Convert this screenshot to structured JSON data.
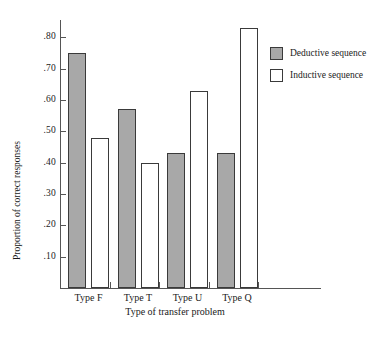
{
  "chart_data": {
    "type": "bar",
    "title": "",
    "subtitle": "",
    "xlabel": "Type of transfer problem",
    "ylabel": "Proportion of correct responses",
    "categories": [
      "Type F",
      "Type T",
      "Type U",
      "Type Q"
    ],
    "series": [
      {
        "name": "Deductive sequence",
        "color": "#a8a8a8",
        "values": [
          0.75,
          0.57,
          0.43,
          0.43
        ]
      },
      {
        "name": "Inductive sequence",
        "color": "#ffffff",
        "values": [
          0.48,
          0.4,
          0.63,
          0.83
        ]
      }
    ],
    "ylim": [
      0.0,
      0.855
    ],
    "ytick_values": [
      0.1,
      0.2,
      0.3,
      0.4,
      0.5,
      0.6,
      0.7,
      0.8
    ],
    "ytick_labels": [
      ".10",
      ".20",
      ".30",
      ".40",
      ".50",
      ".60",
      ".70",
      ".80"
    ],
    "grid": false,
    "legend_position": "right-top",
    "bar_edge_color": "#3a3a3a"
  },
  "legend": {
    "entries": [
      {
        "label": "Deductive sequence"
      },
      {
        "label": "Inductive sequence"
      }
    ]
  },
  "axes": {
    "y_title": "Proportion of correct responses",
    "x_title": "Type of transfer problem"
  }
}
